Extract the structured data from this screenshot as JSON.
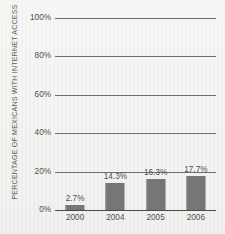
{
  "chart_data": {
    "type": "bar",
    "title": "",
    "subtitle": "",
    "xlabel": "",
    "ylabel": "PERCENTAGE OF MEXICANS WITH INTERNET ACCESS",
    "categories": [
      "2000",
      "2004",
      "2005",
      "2006"
    ],
    "values": [
      2.7,
      14.3,
      16.3,
      17.7
    ],
    "data_labels": [
      "2.7%",
      "14.3%",
      "16.3%",
      "17.7%"
    ],
    "ylim": [
      0,
      100
    ],
    "y_ticks": [
      100,
      80,
      60,
      40,
      20,
      0
    ],
    "y_tick_labels": [
      "100%",
      "80%",
      "60%",
      "40%",
      "20%",
      "0%"
    ],
    "grid": true,
    "legend": false,
    "legend_position": "none",
    "series": [
      {
        "name": "Percentage of Mexicans with internet access",
        "values": [
          2.7,
          14.3,
          16.3,
          17.7
        ]
      }
    ],
    "colors": {
      "bar": "#767676",
      "gridline": "#6f6f6f",
      "axis": "#4a4a4a",
      "text": "#4f4f4f",
      "axis_title": "#5b5b5b",
      "background": "#efefed"
    }
  }
}
